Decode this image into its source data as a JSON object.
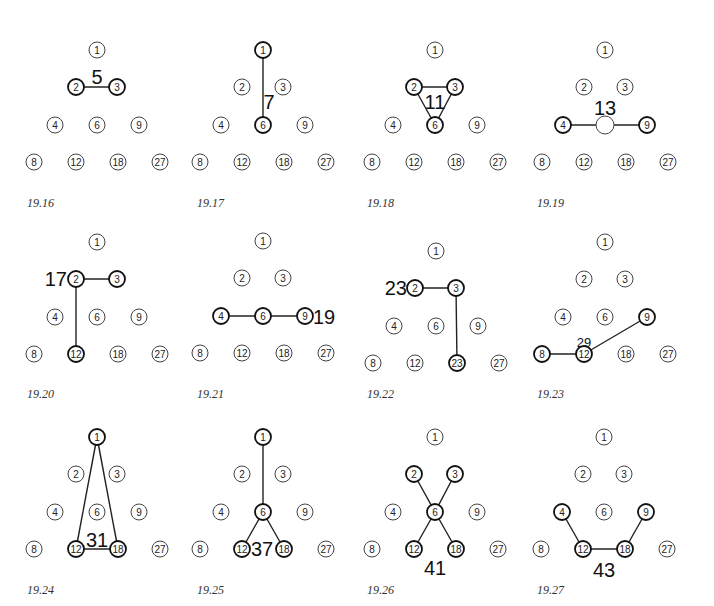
{
  "node_layout": {
    "1": [
      0,
      0
    ],
    "2": [
      -21,
      37
    ],
    "3": [
      20,
      37
    ],
    "4": [
      -42,
      75
    ],
    "6": [
      0,
      75
    ],
    "9": [
      42,
      75
    ],
    "8": [
      -63,
      112
    ],
    "12": [
      -21,
      112
    ],
    "18": [
      21,
      112
    ],
    "27": [
      63,
      112
    ]
  },
  "node_order": [
    "1",
    "2",
    "3",
    "4",
    "6",
    "9",
    "8",
    "12",
    "18",
    "27"
  ],
  "panels": [
    {
      "caption": "19.16",
      "origin": [
        97,
        50
      ],
      "caption_pos": [
        27,
        207
      ],
      "active": [
        "2",
        "3"
      ],
      "edges": [
        [
          "2",
          "3"
        ]
      ],
      "sum_label": {
        "text": "5",
        "pos": [
          97,
          77
        ],
        "size": 20,
        "anchor": "middle"
      }
    },
    {
      "caption": "19.17",
      "origin": [
        263,
        50
      ],
      "caption_pos": [
        197,
        207
      ],
      "active": [
        "1",
        "6"
      ],
      "edges": [
        [
          "1",
          "6"
        ]
      ],
      "sum_label": {
        "text": "7",
        "pos": [
          269,
          102
        ],
        "size": 20,
        "anchor": "middle"
      }
    },
    {
      "caption": "19.18",
      "origin": [
        435,
        50
      ],
      "caption_pos": [
        367,
        207
      ],
      "active": [
        "2",
        "3",
        "6"
      ],
      "edges": [
        [
          "2",
          "3"
        ],
        [
          "2",
          "6"
        ],
        [
          "3",
          "6"
        ]
      ],
      "sum_label": {
        "text": "11",
        "pos": [
          435,
          102
        ],
        "size": 20,
        "anchor": "middle"
      }
    },
    {
      "caption": "19.19",
      "origin": [
        605,
        50
      ],
      "caption_pos": [
        537,
        207
      ],
      "active": [
        "4",
        "9"
      ],
      "edges": [
        [
          "4",
          "6"
        ],
        [
          "6",
          "9"
        ]
      ],
      "hidden_labels": [
        "6"
      ],
      "sum_label": {
        "text": "13",
        "pos": [
          605,
          108
        ],
        "size": 20,
        "anchor": "middle"
      }
    },
    {
      "caption": "19.20",
      "origin": [
        97,
        242
      ],
      "caption_pos": [
        27,
        398
      ],
      "active": [
        "2",
        "3",
        "12"
      ],
      "edges": [
        [
          "2",
          "3"
        ],
        [
          "2",
          "12"
        ]
      ],
      "sum_label": {
        "text": "17",
        "pos": [
          67,
          279
        ],
        "size": 20,
        "anchor": "end"
      }
    },
    {
      "caption": "19.21",
      "origin": [
        263,
        241
      ],
      "caption_pos": [
        197,
        398
      ],
      "active": [
        "4",
        "6",
        "9"
      ],
      "edges": [
        [
          "4",
          "6"
        ],
        [
          "6",
          "9"
        ]
      ],
      "sum_label": {
        "text": "19",
        "pos": [
          313,
          317
        ],
        "size": 20,
        "anchor": "start"
      }
    },
    {
      "caption": "19.22",
      "origin": [
        436,
        251
      ],
      "caption_pos": [
        367,
        398
      ],
      "active": [
        "2",
        "3",
        "23"
      ],
      "edges": [
        [
          "2",
          "3"
        ],
        [
          "3",
          "18"
        ]
      ],
      "relabel": {
        "18": "23"
      },
      "sum_label": {
        "text": "23",
        "pos": [
          407,
          288
        ],
        "size": 20,
        "anchor": "end"
      }
    },
    {
      "caption": "19.23",
      "origin": [
        605,
        242
      ],
      "caption_pos": [
        537,
        398
      ],
      "active": [
        "8",
        "12",
        "9"
      ],
      "edges": [
        [
          "8",
          "12"
        ],
        [
          "12",
          "9"
        ]
      ],
      "thin_edges": true,
      "sum_label": {
        "text": "29",
        "pos": [
          584,
          342
        ],
        "size": 13,
        "anchor": "middle"
      }
    },
    {
      "caption": "19.24",
      "origin": [
        97,
        437
      ],
      "caption_pos": [
        27,
        594
      ],
      "active": [
        "1",
        "12",
        "18"
      ],
      "edges": [
        [
          "1",
          "12"
        ],
        [
          "1",
          "18"
        ],
        [
          "12",
          "18"
        ]
      ],
      "sum_label": {
        "text": "31",
        "pos": [
          97,
          540
        ],
        "size": 20,
        "anchor": "middle"
      }
    },
    {
      "caption": "19.25",
      "origin": [
        263,
        437
      ],
      "caption_pos": [
        197,
        594
      ],
      "active": [
        "1",
        "6",
        "12",
        "18"
      ],
      "edges": [
        [
          "1",
          "6"
        ],
        [
          "6",
          "12"
        ],
        [
          "6",
          "18"
        ]
      ],
      "sum_label": {
        "text": "37",
        "pos": [
          262,
          549
        ],
        "size": 20,
        "anchor": "middle"
      }
    },
    {
      "caption": "19.26",
      "origin": [
        435,
        437
      ],
      "caption_pos": [
        367,
        594
      ],
      "active": [
        "2",
        "3",
        "6",
        "12",
        "18"
      ],
      "edges": [
        [
          "2",
          "6"
        ],
        [
          "3",
          "6"
        ],
        [
          "6",
          "12"
        ],
        [
          "6",
          "18"
        ]
      ],
      "sum_label": {
        "text": "41",
        "pos": [
          435,
          568
        ],
        "size": 20,
        "anchor": "middle"
      }
    },
    {
      "caption": "19.27",
      "origin": [
        604,
        437
      ],
      "caption_pos": [
        537,
        594
      ],
      "active": [
        "4",
        "9",
        "12",
        "18"
      ],
      "edges": [
        [
          "4",
          "12"
        ],
        [
          "12",
          "18"
        ],
        [
          "18",
          "9"
        ]
      ],
      "sum_label": {
        "text": "43",
        "pos": [
          604,
          570
        ],
        "size": 20,
        "anchor": "middle"
      }
    }
  ]
}
